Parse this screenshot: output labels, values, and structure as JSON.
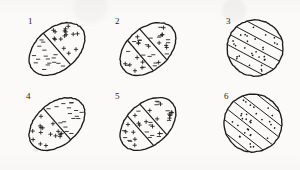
{
  "sheet": {
    "title": "Six hatched ellipse and circle diagrams",
    "background_color": "#fbfaf8",
    "ink_color": "#1d1c1b",
    "width": 300,
    "height": 170
  },
  "figures": [
    {
      "label": "1",
      "shape": "ellipse",
      "label_x": 28,
      "label_y": 24,
      "cx": 57,
      "cy": 49,
      "rx": 32,
      "ry": 21,
      "rotation": -41,
      "divider_count": 1,
      "divider_offsets": [
        0
      ],
      "bands": [
        {
          "fill_mark": "dash",
          "count": 17
        },
        {
          "fill_mark": "plus",
          "count": 16
        }
      ]
    },
    {
      "label": "2",
      "shape": "ellipse",
      "label_x": 115,
      "label_y": 24,
      "cx": 148,
      "cy": 49,
      "rx": 32,
      "ry": 21,
      "rotation": -41,
      "divider_count": 2,
      "divider_offsets": [
        -10,
        7
      ],
      "bands": [
        {
          "fill_mark": "mixed",
          "count": 9
        },
        {
          "fill_mark": "mixed",
          "count": 14
        },
        {
          "fill_mark": "mixed",
          "count": 13
        }
      ]
    },
    {
      "label": "3",
      "shape": "circle",
      "label_x": 226,
      "label_y": 24,
      "cx": 255,
      "cy": 48,
      "rx": 28,
      "ry": 28,
      "rotation": -62,
      "divider_count": 5,
      "divider_offsets": [
        -20,
        -10,
        0,
        10,
        20
      ],
      "bands": [
        {
          "fill_mark": "dot",
          "count": 30
        }
      ]
    },
    {
      "label": "4",
      "shape": "ellipse",
      "label_x": 26,
      "label_y": 99,
      "cx": 57,
      "cy": 124,
      "rx": 32,
      "ry": 21,
      "rotation": -41,
      "divider_count": 1,
      "divider_offsets": [
        0
      ],
      "bands": [
        {
          "fill_mark": "plus",
          "count": 16
        },
        {
          "fill_mark": "dash",
          "count": 17
        }
      ]
    },
    {
      "label": "5",
      "shape": "ellipse",
      "label_x": 115,
      "label_y": 99,
      "cx": 148,
      "cy": 124,
      "rx": 32,
      "ry": 21,
      "rotation": -41,
      "divider_count": 2,
      "divider_offsets": [
        -10,
        7
      ],
      "bands": [
        {
          "fill_mark": "mixed",
          "count": 9
        },
        {
          "fill_mark": "mixed",
          "count": 14
        },
        {
          "fill_mark": "mixed",
          "count": 13
        }
      ]
    },
    {
      "label": "6",
      "shape": "circle",
      "label_x": 224,
      "label_y": 99,
      "cx": 253,
      "cy": 123,
      "rx": 29,
      "ry": 29,
      "rotation": -52,
      "divider_count": 6,
      "divider_offsets": [
        -25,
        -15,
        -5,
        5,
        15,
        25
      ],
      "bands": [
        {
          "fill_mark": "dot",
          "count": 32
        }
      ]
    }
  ],
  "chart_data": {
    "type": "table",
    "categories": [
      "1",
      "2",
      "3",
      "4",
      "5",
      "6"
    ],
    "series": [
      {
        "name": "divider_lines",
        "values": [
          1,
          2,
          5,
          1,
          2,
          6
        ]
      },
      {
        "name": "regions",
        "values": [
          2,
          3,
          6,
          2,
          3,
          7
        ]
      }
    ]
  }
}
